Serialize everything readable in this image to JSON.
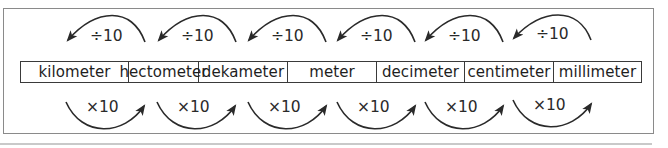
{
  "diagram": {
    "units": [
      {
        "label": "kilometer",
        "width": 108
      },
      {
        "label": "hectometer",
        "width": 70
      },
      {
        "label": "dekameter",
        "width": 89
      },
      {
        "label": "meter",
        "width": 89
      },
      {
        "label": "decimeter",
        "width": 88
      },
      {
        "label": "centimeter",
        "width": 89
      },
      {
        "label": "millimeter",
        "width": 87
      }
    ],
    "top_operations": [
      {
        "label": "÷10",
        "direction": "left"
      },
      {
        "label": "÷10",
        "direction": "left"
      },
      {
        "label": "÷10",
        "direction": "left"
      },
      {
        "label": "÷10",
        "direction": "left"
      },
      {
        "label": "÷10",
        "direction": "left"
      },
      {
        "label": "÷10",
        "direction": "left"
      }
    ],
    "bottom_operations": [
      {
        "label": "×10",
        "direction": "right"
      },
      {
        "label": "×10",
        "direction": "right"
      },
      {
        "label": "×10",
        "direction": "right"
      },
      {
        "label": "×10",
        "direction": "right"
      },
      {
        "label": "×10",
        "direction": "right"
      },
      {
        "label": "×10",
        "direction": "right"
      }
    ],
    "colors": {
      "stroke": "#2a2a2a",
      "frame": "#8a8a8a",
      "rule": "#c9c9c9"
    }
  }
}
